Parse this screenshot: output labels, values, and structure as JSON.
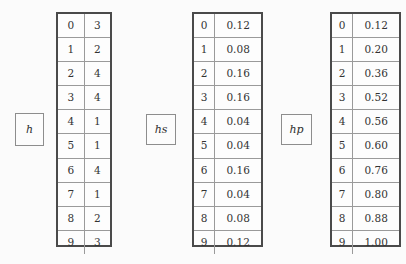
{
  "chart_data": {
    "type": "table",
    "title": "",
    "tables": [
      {
        "name": "h",
        "label": "h",
        "label_main": "h",
        "label_sub": "",
        "columns": [
          "index",
          "value"
        ],
        "indices": [
          0,
          1,
          2,
          3,
          4,
          5,
          6,
          7,
          8,
          9
        ],
        "values": [
          "3",
          "2",
          "4",
          "4",
          "1",
          "1",
          "4",
          "1",
          "2",
          "3"
        ]
      },
      {
        "name": "hs",
        "label": "hs",
        "label_main": "h",
        "label_sub": "s",
        "columns": [
          "index",
          "value"
        ],
        "indices": [
          0,
          1,
          2,
          3,
          4,
          5,
          6,
          7,
          8,
          9
        ],
        "values": [
          "0.12",
          "0.08",
          "0.16",
          "0.16",
          "0.04",
          "0.04",
          "0.16",
          "0.04",
          "0.08",
          "0.12"
        ]
      },
      {
        "name": "hp",
        "label": "hp",
        "label_main": "h",
        "label_sub": "p",
        "columns": [
          "index",
          "value"
        ],
        "indices": [
          0,
          1,
          2,
          3,
          4,
          5,
          6,
          7,
          8,
          9
        ],
        "values": [
          "0.12",
          "0.20",
          "0.36",
          "0.52",
          "0.56",
          "0.60",
          "0.76",
          "0.80",
          "0.88",
          "1.00"
        ]
      }
    ]
  },
  "colors": {
    "background": "#fbfbfb",
    "table_outer_border": "#4a4a4a",
    "table_inner_border": "#9a9a9a",
    "label_border": "#8d8d8d",
    "text": "#333333"
  }
}
